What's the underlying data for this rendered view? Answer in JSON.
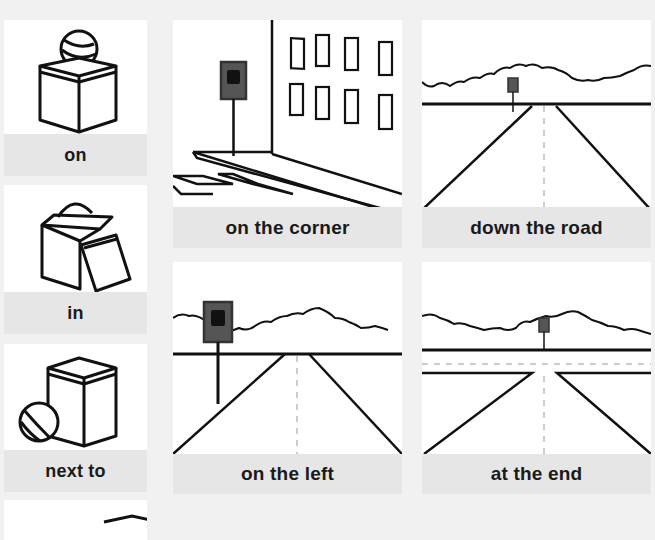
{
  "worksheet": {
    "colors": {
      "background": "#f1f1f1",
      "card": "#ffffff",
      "label_bar": "#e6e6e6",
      "ink": "#111111",
      "sign": "#555555"
    },
    "left_column": [
      {
        "label": "on",
        "icon": "ball-on-box-icon"
      },
      {
        "label": "in",
        "icon": "ball-in-box-icon"
      },
      {
        "label": "next to",
        "icon": "ball-next-to-box-icon"
      },
      {
        "label": "",
        "icon": "box-partial-icon"
      }
    ],
    "grid": [
      {
        "label": "on the corner",
        "icon": "bus-stop-corner-icon"
      },
      {
        "label": "down the road",
        "icon": "bus-stop-down-road-icon"
      },
      {
        "label": "on the left",
        "icon": "bus-stop-left-icon"
      },
      {
        "label": "at the end",
        "icon": "bus-stop-end-icon"
      }
    ]
  }
}
